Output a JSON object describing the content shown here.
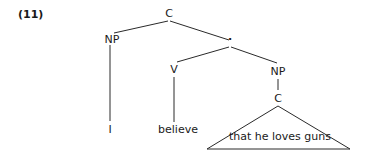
{
  "example_number": "(11)",
  "tree": {
    "root": {
      "label": "C"
    },
    "subject_np": {
      "label": "NP"
    },
    "intermediate_node": {
      "label": "·"
    },
    "verb": {
      "label": "V"
    },
    "object_np": {
      "label": "NP"
    },
    "embedded_c": {
      "label": "C"
    },
    "leaves": {
      "subject": "I",
      "verb": "believe",
      "clause": "that he loves guns"
    }
  }
}
